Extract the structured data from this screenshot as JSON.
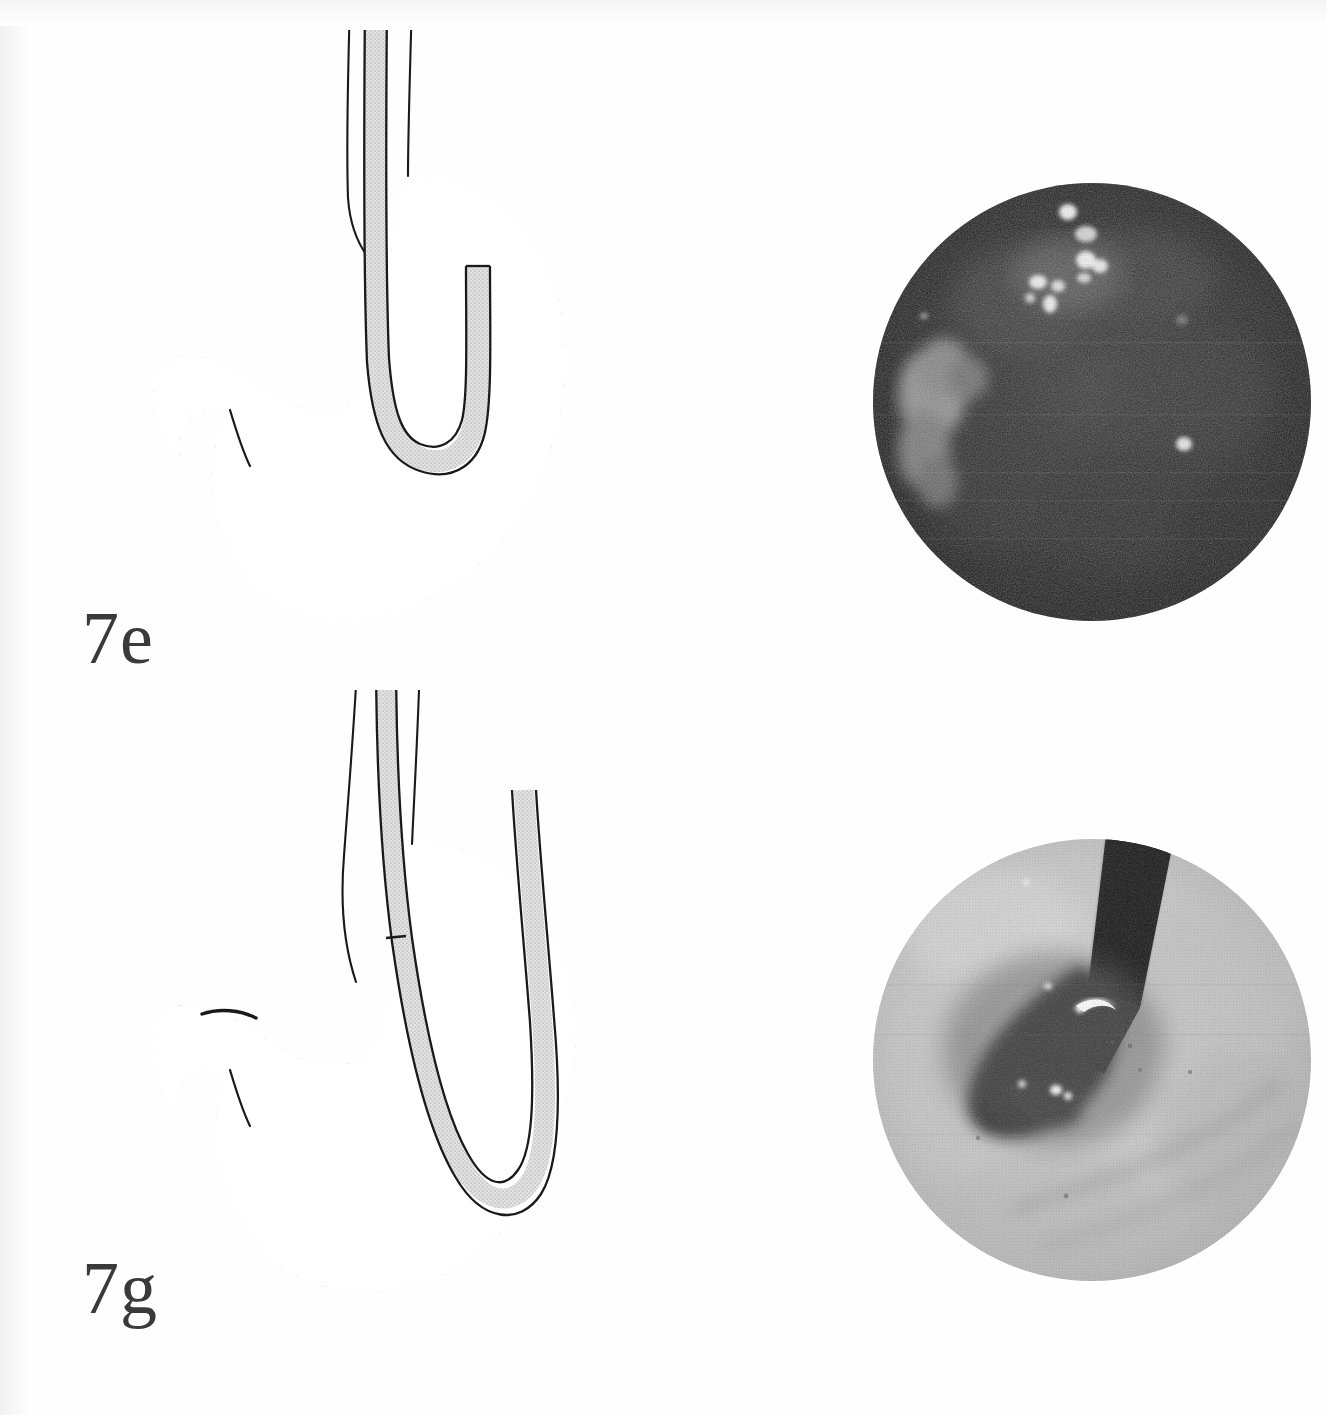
{
  "figure": {
    "kind": "medical-textbook-plate",
    "background_color": "#ffffff",
    "ink_color": "#1a1a1a",
    "label_color": "#3a3a3a"
  },
  "panels": [
    {
      "id": "7e",
      "label": "7e",
      "drawing": {
        "name": "stomach-endoscope-diagram-7e",
        "organ": "stomach",
        "view": "schematic sagittal section",
        "mucosa_fill": "#ffffff",
        "hatching": "diagonal",
        "hatch_color": "#2a2a2a",
        "outline_color": "#1a1a1a",
        "instrument": "fibre-endoscope",
        "instrument_fill": "#d8d8d8",
        "instrument_position": "shaft descends the oesophagus, tip retroflexed into a short J-loop within the gastric body",
        "features": [
          "oesophagus",
          "cardia",
          "fundus",
          "gastric body",
          "antrum",
          "pylorus",
          "duodenal bulb",
          "lesser curvature",
          "greater curvature"
        ]
      },
      "photo": {
        "name": "endoscopic-photo-7e",
        "shape": "circle",
        "exposure": "dark / underexposed",
        "base_color": "#262626",
        "description": "Dark gastric lumen with scattered bright specular light reflections in the upper field and a pale mucosal fold along the left margin.",
        "highlights": "cluster of small white specular spots upper-centre; broad pale patch on left"
      }
    },
    {
      "id": "7g",
      "label": "7g",
      "drawing": {
        "name": "stomach-endoscope-diagram-7g",
        "organ": "stomach",
        "view": "schematic sagittal section",
        "mucosa_fill": "#ffffff",
        "hatching": "horizontal",
        "hatch_color": "#2a2a2a",
        "outline_color": "#1a1a1a",
        "instrument": "fibre-endoscope",
        "instrument_fill": "#d8d8d8",
        "instrument_position": "shaft follows the lesser curvature, tip forms a deep J-loop reaching the greater curvature; upper stomach gas-filled and unshaded",
        "features": [
          "oesophagus",
          "cardia",
          "fundus",
          "gastric body",
          "antrum",
          "pylorus",
          "duodenal bulb",
          "lesser curvature",
          "greater curvature"
        ]
      },
      "photo": {
        "name": "endoscopic-photo-7g",
        "shape": "circle",
        "exposure": "bright / well-lit",
        "base_color": "#c9c9c9",
        "description": "Retroflexed view of the gastric cardia: the dark endoscope shaft enters from the upper right and passes into a dark wedge-shaped cardial opening, with a bright crescent reflection on the shaft.",
        "highlights": "bright crescent reflection on the shaft mid-field; two small white specks lower on the shaft"
      }
    }
  ]
}
